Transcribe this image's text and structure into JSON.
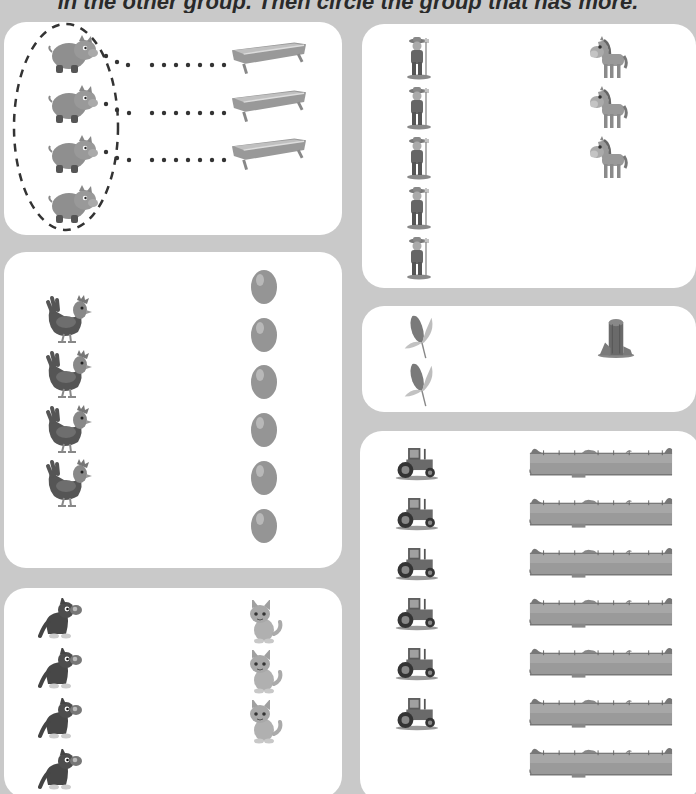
{
  "header": {
    "instruction": "in the other group. Then circle the group that has more."
  },
  "colors": {
    "background": "#c9c9c9",
    "box": "#ffffff",
    "icon_dark": "#4a4a4a",
    "icon_mid": "#8a8a8a",
    "icon_light": "#b5b5b5",
    "dotted_line": "#3a3a3a"
  },
  "exercises": [
    {
      "id": "pigs-troughs",
      "left_group": {
        "label": "pigs",
        "icon": "pig-icon",
        "count": 4
      },
      "right_group": {
        "label": "feeding troughs",
        "icon": "trough-icon",
        "count": 3
      },
      "matched_pairs": 3,
      "circled": "left",
      "example": true
    },
    {
      "id": "farmers-horses",
      "left_group": {
        "label": "farmers",
        "icon": "farmer-icon",
        "count": 5
      },
      "right_group": {
        "label": "horses",
        "icon": "horse-icon",
        "count": 3
      }
    },
    {
      "id": "hens-eggs",
      "left_group": {
        "label": "hens",
        "icon": "hen-icon",
        "count": 4
      },
      "right_group": {
        "label": "eggs",
        "icon": "egg-icon",
        "count": 6
      }
    },
    {
      "id": "corn-silo",
      "left_group": {
        "label": "corn",
        "icon": "corn-icon",
        "count": 2
      },
      "right_group": {
        "label": "silos",
        "icon": "silo-icon",
        "count": 1
      }
    },
    {
      "id": "dogs-cats",
      "left_group": {
        "label": "dogs",
        "icon": "dog-icon",
        "count": 4
      },
      "right_group": {
        "label": "cats",
        "icon": "cat-icon",
        "count": 3
      }
    },
    {
      "id": "tractors-fences",
      "left_group": {
        "label": "tractors",
        "icon": "tractor-icon",
        "count": 6
      },
      "right_group": {
        "label": "fences",
        "icon": "fence-icon",
        "count": 7
      }
    }
  ]
}
